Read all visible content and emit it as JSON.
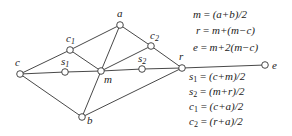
{
  "diagram": {
    "type": "geometric-construction",
    "points": [
      {
        "id": "c",
        "label": "c",
        "sub": "",
        "x": 20,
        "y": 74,
        "lx": 15,
        "ly": 66
      },
      {
        "id": "a",
        "label": "a",
        "sub": "",
        "x": 120,
        "y": 25,
        "lx": 117,
        "ly": 17
      },
      {
        "id": "b",
        "label": "b",
        "sub": "",
        "x": 82,
        "y": 117,
        "lx": 87,
        "ly": 124
      },
      {
        "id": "m",
        "label": "m",
        "sub": "",
        "x": 101,
        "y": 71,
        "lx": 104,
        "ly": 83
      },
      {
        "id": "r",
        "label": "r",
        "sub": "",
        "x": 182,
        "y": 68,
        "lx": 179,
        "ly": 60
      },
      {
        "id": "e",
        "label": "e",
        "sub": "",
        "x": 265,
        "y": 65,
        "lx": 272,
        "ly": 69
      },
      {
        "id": "c1",
        "label": "c",
        "sub": "1",
        "x": 70,
        "y": 50,
        "lx": 66,
        "ly": 42
      },
      {
        "id": "c2",
        "label": "c",
        "sub": "2",
        "x": 151,
        "y": 46,
        "lx": 150,
        "ly": 39
      },
      {
        "id": "s1",
        "label": "s",
        "sub": "1",
        "x": 65,
        "y": 72,
        "lx": 61,
        "ly": 65
      },
      {
        "id": "s2",
        "label": "s",
        "sub": "2",
        "x": 142,
        "y": 69,
        "lx": 138,
        "ly": 62
      }
    ],
    "edges": [
      [
        "c",
        "c1"
      ],
      [
        "c1",
        "a"
      ],
      [
        "a",
        "c2"
      ],
      [
        "c2",
        "r"
      ],
      [
        "c",
        "b"
      ],
      [
        "b",
        "r"
      ],
      [
        "a",
        "m"
      ],
      [
        "m",
        "b"
      ],
      [
        "c1",
        "m"
      ],
      [
        "m",
        "c2"
      ],
      [
        "c",
        "s1"
      ],
      [
        "s1",
        "m"
      ],
      [
        "m",
        "s2"
      ],
      [
        "s2",
        "r"
      ],
      [
        "r",
        "e"
      ]
    ],
    "equations_top": [
      {
        "lhs": "m",
        "lhs_sub": "",
        "rhs": "(a+b)/2"
      },
      {
        "lhs": "r",
        "lhs_sub": "",
        "rhs": "m+(m−c)"
      },
      {
        "lhs": "e",
        "lhs_sub": "",
        "rhs": "m+2(m−c)"
      }
    ],
    "equations_bottom": [
      {
        "lhs": "s",
        "lhs_sub": "1",
        "rhs": "(c+m)/2"
      },
      {
        "lhs": "s",
        "lhs_sub": "2",
        "rhs": "(m+r)/2"
      },
      {
        "lhs": "c",
        "lhs_sub": "1",
        "rhs": "(c+a)/2"
      },
      {
        "lhs": "c",
        "lhs_sub": "2",
        "rhs": "(r+a)/2"
      }
    ]
  },
  "equation_text": {
    "eq1": "m = (a+b)/2",
    "eq2": "r = m+(m−c)",
    "eq3": "e = m+2(m−c)",
    "eq4": "s1 = (c+m)/2",
    "eq5": "s2 = (m+r)/2",
    "eq6": "c1 = (c+a)/2",
    "eq7": "c2 = (r+a)/2"
  }
}
